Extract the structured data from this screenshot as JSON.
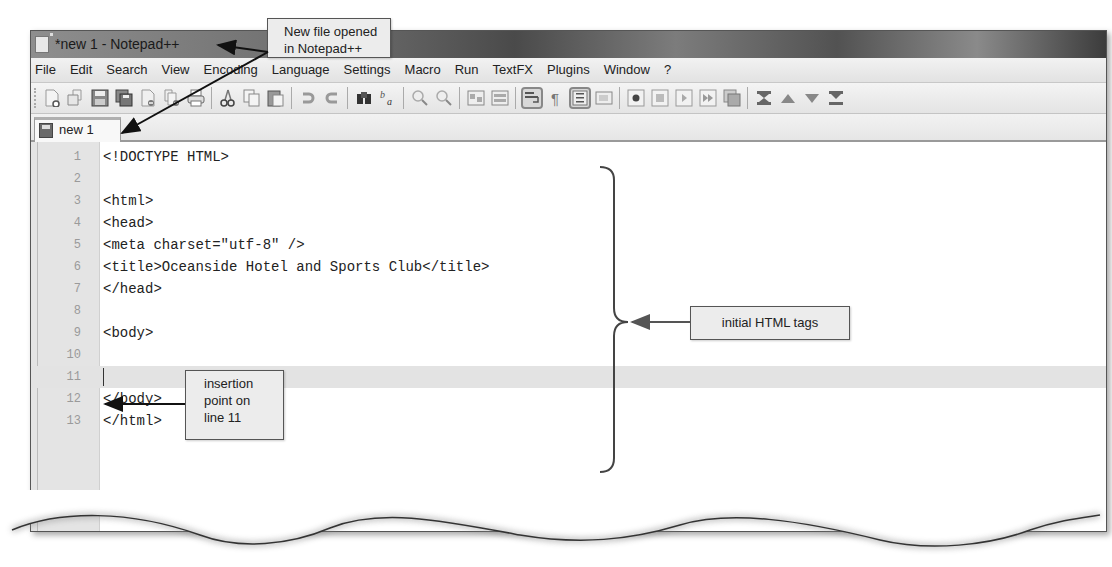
{
  "window": {
    "title": "*new  1 - Notepad++"
  },
  "menubar": {
    "items": [
      "File",
      "Edit",
      "Search",
      "View",
      "Encoding",
      "Language",
      "Settings",
      "Macro",
      "Run",
      "TextFX",
      "Plugins",
      "Window",
      "?"
    ]
  },
  "toolbar": {
    "buttons": [
      "new-file",
      "open-file",
      "save",
      "save-all",
      "close",
      "close-all",
      "print",
      "cut",
      "copy",
      "paste",
      "undo",
      "redo",
      "find",
      "replace",
      "zoom-in",
      "zoom-out",
      "sync-vertical",
      "sync-horizontal",
      "word-wrap",
      "show-all-characters",
      "indent-guide",
      "user-defined-language",
      "start-recording",
      "stop-recording",
      "playback",
      "run-macro-multiple",
      "save-macro",
      "trim",
      "move-up",
      "move-down",
      "more"
    ]
  },
  "tabs": [
    {
      "label": "new 1",
      "active": true
    }
  ],
  "editor": {
    "lines": [
      {
        "num": "1",
        "code": "<!DOCTYPE HTML>"
      },
      {
        "num": "2",
        "code": ""
      },
      {
        "num": "3",
        "code": "<html>"
      },
      {
        "num": "4",
        "code": "<head>"
      },
      {
        "num": "5",
        "code": "<meta charset=\"utf-8\" />"
      },
      {
        "num": "6",
        "code": "<title>Oceanside Hotel and Sports Club</title>"
      },
      {
        "num": "7",
        "code": "</head>"
      },
      {
        "num": "8",
        "code": ""
      },
      {
        "num": "9",
        "code": "<body>"
      },
      {
        "num": "10",
        "code": ""
      },
      {
        "num": "11",
        "code": ""
      },
      {
        "num": "12",
        "code": "</body>"
      },
      {
        "num": "13",
        "code": "</html>"
      }
    ],
    "current_line": 11
  },
  "callouts": {
    "new_file": {
      "line1": "New file opened",
      "line2": "in Notepad++"
    },
    "initial_tags": {
      "text": "initial HTML tags"
    },
    "insertion": {
      "line1": "insertion",
      "line2": "point on",
      "line3": "line 11"
    }
  }
}
